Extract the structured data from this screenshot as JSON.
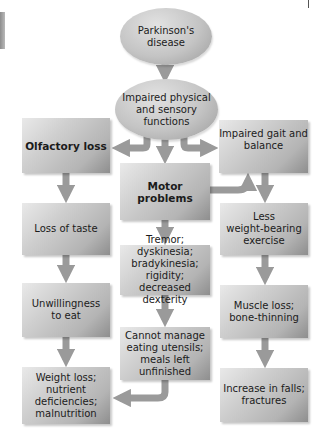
{
  "diagram": {
    "type": "flowchart",
    "colors": {
      "node_fill": "#c4c4c4",
      "arrow": "#9a9a9a",
      "text": "#1b1b1b",
      "background": "#ffffff"
    },
    "nodes": {
      "parkinsons": {
        "label": "Parkinson's\ndisease",
        "shape": "oval"
      },
      "impaired_functions": {
        "label": "Impaired physical\nand sensory\nfunctions",
        "shape": "oval"
      },
      "olfactory_loss": {
        "label": "Olfactory loss",
        "shape": "box",
        "bold": true
      },
      "motor_problems": {
        "label": "Motor problems",
        "shape": "box",
        "bold": true
      },
      "impaired_gait": {
        "label": "Impaired gait and\nbalance",
        "shape": "box"
      },
      "loss_of_taste": {
        "label": "Loss of taste",
        "shape": "box"
      },
      "tremor": {
        "label": "Tremor; dyskinesia;\nbradykinesia;\nrigidity; decreased\ndexterity",
        "shape": "box"
      },
      "less_weight_bearing": {
        "label": "Less\nweight-bearing\nexercise",
        "shape": "box"
      },
      "unwillingness": {
        "label": "Unwillingness\nto eat",
        "shape": "box"
      },
      "cannot_manage": {
        "label": "Cannot manage\neating utensils;\nmeals left\nunfinished",
        "shape": "box"
      },
      "muscle_loss": {
        "label": "Muscle loss;\nbone-thinning",
        "shape": "box"
      },
      "weight_loss": {
        "label": "Weight loss;\nnutrient\ndeficiencies;\nmalnutrition",
        "shape": "box"
      },
      "increase_falls": {
        "label": "Increase in falls;\nfractures",
        "shape": "box"
      }
    },
    "edges": [
      {
        "from": "parkinsons",
        "to": "impaired_functions"
      },
      {
        "from": "impaired_functions",
        "to": "olfactory_loss"
      },
      {
        "from": "impaired_functions",
        "to": "motor_problems"
      },
      {
        "from": "impaired_functions",
        "to": "impaired_gait"
      },
      {
        "from": "motor_problems",
        "to": "impaired_gait"
      },
      {
        "from": "olfactory_loss",
        "to": "loss_of_taste"
      },
      {
        "from": "loss_of_taste",
        "to": "unwillingness"
      },
      {
        "from": "unwillingness",
        "to": "weight_loss"
      },
      {
        "from": "motor_problems",
        "to": "tremor"
      },
      {
        "from": "tremor",
        "to": "cannot_manage"
      },
      {
        "from": "cannot_manage",
        "to": "weight_loss"
      },
      {
        "from": "impaired_gait",
        "to": "less_weight_bearing"
      },
      {
        "from": "less_weight_bearing",
        "to": "muscle_loss"
      },
      {
        "from": "muscle_loss",
        "to": "increase_falls"
      }
    ]
  }
}
